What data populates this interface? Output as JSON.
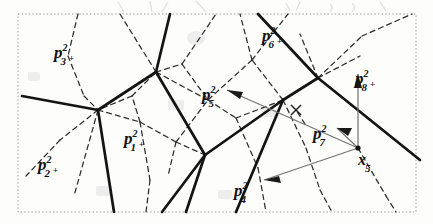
{
  "figure": {
    "kind": "voronoi-delaunay-diagram",
    "caption": "",
    "background_color": "#fdfdfb",
    "frame": {
      "style": "dotted",
      "color": "#9a9a9a",
      "x": 18,
      "y": 14,
      "width": 398,
      "height": 198
    },
    "legend_note": "solid = Voronoi edges, dashed = Delaunay edges, thin gray = displacement vectors from x5",
    "colors": {
      "voronoi_edge": "#161616",
      "delaunay_edge": "#2a2a2a",
      "vector": "#6e6e6e",
      "label": "#121212",
      "scan_artifact": "#dedede"
    },
    "labels": [
      {
        "name": "p3",
        "base": "p",
        "sup": "2",
        "sub": "3",
        "marker": "+",
        "x": 54,
        "y": 44
      },
      {
        "name": "p2",
        "base": "p",
        "sup": "2",
        "sub": "2",
        "marker": "+",
        "x": 38,
        "y": 156
      },
      {
        "name": "p1",
        "base": "p",
        "sup": "2",
        "sub": "1",
        "marker": "+",
        "x": 124,
        "y": 130
      },
      {
        "name": "p5",
        "base": "p",
        "sup": "2",
        "sub": "5",
        "marker": "",
        "x": 202,
        "y": 86
      },
      {
        "name": "p6",
        "base": "p",
        "sup": "2",
        "sub": "6",
        "marker": "+",
        "x": 262,
        "y": 27
      },
      {
        "name": "p8",
        "base": "p",
        "sup": "2",
        "sub": "8",
        "marker": "+",
        "x": 355,
        "y": 70
      },
      {
        "name": "p7",
        "base": "p",
        "sup": "2",
        "sub": "7",
        "marker": "",
        "x": 313,
        "y": 125
      },
      {
        "name": "p4",
        "base": "p",
        "sup": "2",
        "sub": "4",
        "marker": "",
        "x": 234,
        "y": 182
      },
      {
        "name": "x5",
        "base": "x",
        "sup": "",
        "sub": "5",
        "marker": "",
        "x": 358,
        "y": 152
      }
    ],
    "site_point": {
      "name": "x5",
      "x": 358,
      "y": 148
    },
    "cross_marker": {
      "x": 296,
      "y": 110
    },
    "vectors": [
      {
        "from": "x5",
        "to": "p5",
        "label": "p5"
      },
      {
        "from": "x5",
        "to": "p7",
        "label": "p7"
      },
      {
        "from": "x5",
        "to": "p4",
        "label": "p4"
      },
      {
        "from": "x5",
        "to": "p8",
        "label": "p8"
      }
    ],
    "voronoi_vertices": [
      {
        "id": "v1",
        "x": 98,
        "y": 110
      },
      {
        "id": "v2",
        "x": 156,
        "y": 72
      },
      {
        "id": "v3",
        "x": 205,
        "y": 155
      },
      {
        "id": "v4",
        "x": 283,
        "y": 100
      },
      {
        "id": "v5",
        "x": 318,
        "y": 78
      }
    ]
  }
}
